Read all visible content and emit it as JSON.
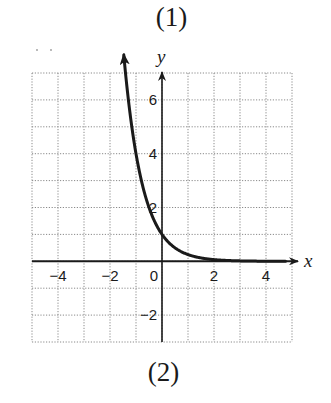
{
  "captions": {
    "top": "(1)",
    "bottom": "(2)"
  },
  "chart_data": {
    "type": "line",
    "title": "",
    "xlabel": "x",
    "ylabel": "y",
    "xlim": [
      -5,
      5
    ],
    "ylim": [
      -3,
      7
    ],
    "grid": true,
    "x_ticks": [
      -4,
      -2,
      0,
      2,
      4
    ],
    "x_tick_labels": [
      "−4",
      "−2",
      "0",
      "2",
      "4"
    ],
    "y_ticks": [
      -2,
      2,
      4,
      6
    ],
    "y_tick_labels": [
      "−2",
      "2",
      "4",
      "6"
    ],
    "series": [
      {
        "name": "y = (1/4)^x",
        "x": [
          -1.46,
          -1.25,
          -1.0,
          -0.75,
          -0.5,
          -0.25,
          0,
          0.25,
          0.5,
          1.0,
          1.5,
          2.0,
          3.0,
          4.0,
          4.8
        ],
        "y": [
          7.55,
          5.66,
          4.0,
          2.83,
          2.0,
          1.41,
          1.0,
          0.71,
          0.5,
          0.25,
          0.125,
          0.0625,
          0.016,
          0.004,
          0.001
        ]
      }
    ],
    "annotations": [
      "arrowhead at upper end of curve",
      "arrowheads on positive x and y axes"
    ]
  },
  "colors": {
    "ink": "#1a1a1a",
    "grid": "#8a8a8a",
    "background": "#ffffff"
  }
}
